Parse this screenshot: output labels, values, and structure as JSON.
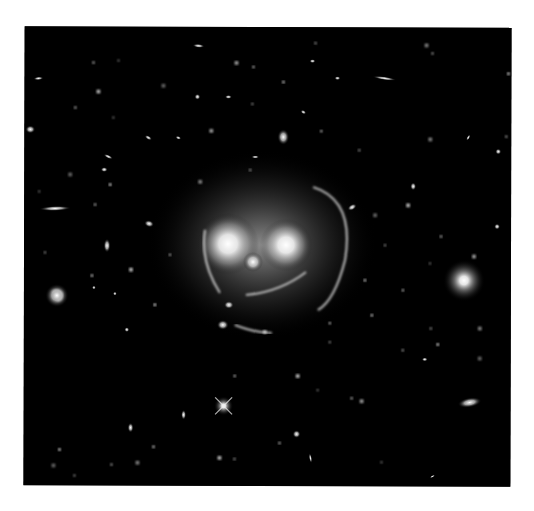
{
  "image": {
    "subject": "galaxy cluster with gravitational lensing arcs (smiley-face shape)",
    "background_color": "#000000",
    "page_color": "#ffffff",
    "frame": {
      "x": 24,
      "y": 27,
      "width": 487,
      "height": 459
    }
  },
  "cluster": {
    "halo": {
      "cx": 262,
      "cy": 245,
      "rx": 115,
      "ry": 95
    },
    "eyes": [
      {
        "cx": 228,
        "cy": 244,
        "r": 14
      },
      {
        "cx": 286,
        "cy": 245,
        "r": 12
      }
    ],
    "nose": {
      "cx": 253,
      "cy": 262,
      "r": 5
    },
    "arcs": [
      {
        "name": "right-ring-arc",
        "d": "M 313 187 Q 355 200 345 260 Q 335 300 318 310"
      },
      {
        "name": "left-ring-arc",
        "d": "M 205 230 Q 200 262 220 293"
      },
      {
        "name": "smile-arc",
        "d": "M 246 295 Q 280 292 306 272"
      },
      {
        "name": "lower-smile-arc",
        "d": "M 235 325 Q 255 333 272 333"
      }
    ]
  },
  "objects": [
    {
      "type": "spiral",
      "cx": 57,
      "cy": 296,
      "r": 9
    },
    {
      "type": "elliptical",
      "cx": 464,
      "cy": 280,
      "r": 14
    },
    {
      "type": "star",
      "cx": 224,
      "cy": 406,
      "r": 6
    },
    {
      "type": "edge-on",
      "cx": 55,
      "cy": 209,
      "rx": 16,
      "ry": 2.5,
      "rot": -2
    },
    {
      "type": "edge-on",
      "cx": 384,
      "cy": 78,
      "rx": 12,
      "ry": 1.8,
      "rot": 8
    },
    {
      "type": "elliptical",
      "cx": 470,
      "cy": 402,
      "rx": 12,
      "ry": 5,
      "rot": -10
    },
    {
      "type": "elliptical",
      "cx": 283,
      "cy": 137,
      "rx": 6,
      "ry": 8,
      "rot": 0
    },
    {
      "type": "elliptical",
      "cx": 107,
      "cy": 246,
      "rx": 3.5,
      "ry": 7,
      "rot": 0
    },
    {
      "type": "elliptical",
      "cx": 149,
      "cy": 224,
      "rx": 5,
      "ry": 3.5,
      "rot": 15
    },
    {
      "type": "elliptical",
      "cx": 30,
      "cy": 130,
      "rx": 5,
      "ry": 4,
      "rot": 0
    },
    {
      "type": "elliptical",
      "cx": 198,
      "cy": 46,
      "rx": 6,
      "ry": 2,
      "rot": 5
    },
    {
      "type": "elliptical",
      "cx": 104,
      "cy": 170,
      "rx": 3.5,
      "ry": 2.5,
      "rot": 0
    },
    {
      "type": "elliptical",
      "cx": 197,
      "cy": 97,
      "rx": 3,
      "ry": 3,
      "rot": 0
    },
    {
      "type": "elliptical",
      "cx": 108,
      "cy": 157,
      "rx": 5,
      "ry": 1.8,
      "rot": 25
    },
    {
      "type": "elliptical",
      "cx": 38,
      "cy": 79,
      "rx": 5,
      "ry": 1.8,
      "rot": -5
    },
    {
      "type": "elliptical",
      "cx": 223,
      "cy": 325,
      "rx": 6,
      "ry": 5,
      "rot": 0
    },
    {
      "type": "elliptical",
      "cx": 229,
      "cy": 305,
      "rx": 5,
      "ry": 4,
      "rot": 0
    },
    {
      "type": "elliptical",
      "cx": 352,
      "cy": 207,
      "rx": 5,
      "ry": 3,
      "rot": -30
    },
    {
      "type": "elliptical",
      "cx": 297,
      "cy": 434,
      "rx": 4,
      "ry": 4,
      "rot": 0
    },
    {
      "type": "elliptical",
      "cx": 131,
      "cy": 428,
      "rx": 3,
      "ry": 5,
      "rot": 0
    },
    {
      "type": "elliptical",
      "cx": 311,
      "cy": 458,
      "rx": 1.5,
      "ry": 5,
      "rot": -10
    },
    {
      "type": "elliptical",
      "cx": 184,
      "cy": 415,
      "rx": 2.5,
      "ry": 5,
      "rot": 0
    },
    {
      "type": "elliptical",
      "cx": 413,
      "cy": 186,
      "rx": 3,
      "ry": 4,
      "rot": 0
    },
    {
      "type": "elliptical",
      "cx": 497,
      "cy": 226,
      "rx": 3,
      "ry": 3,
      "rot": 0
    },
    {
      "type": "elliptical",
      "cx": 312,
      "cy": 61,
      "rx": 3,
      "ry": 2,
      "rot": 0
    },
    {
      "type": "elliptical",
      "cx": 337,
      "cy": 78,
      "rx": 3,
      "ry": 2,
      "rot": 0
    },
    {
      "type": "elliptical",
      "cx": 228,
      "cy": 97,
      "rx": 3.5,
      "ry": 2,
      "rot": 0
    },
    {
      "type": "elliptical",
      "cx": 303,
      "cy": 112,
      "rx": 3,
      "ry": 2,
      "rot": 30
    },
    {
      "type": "elliptical",
      "cx": 498,
      "cy": 151,
      "rx": 3,
      "ry": 3,
      "rot": 0
    },
    {
      "type": "elliptical",
      "cx": 468,
      "cy": 137,
      "rx": 1.5,
      "ry": 3.5,
      "rot": 30
    },
    {
      "type": "elliptical",
      "cx": 127,
      "cy": 330,
      "rx": 2.5,
      "ry": 2.5,
      "rot": 0
    },
    {
      "type": "elliptical",
      "cx": 178,
      "cy": 138,
      "rx": 3,
      "ry": 1.8,
      "rot": 20
    },
    {
      "type": "elliptical",
      "cx": 115,
      "cy": 294,
      "rx": 2,
      "ry": 2,
      "rot": 0
    },
    {
      "type": "elliptical",
      "cx": 94,
      "cy": 288,
      "rx": 2,
      "ry": 2,
      "rot": 0
    },
    {
      "type": "elliptical",
      "cx": 148,
      "cy": 138,
      "rx": 4,
      "ry": 2,
      "rot": 30
    },
    {
      "type": "elliptical",
      "cx": 255,
      "cy": 157,
      "rx": 4,
      "ry": 1.5,
      "rot": 0
    },
    {
      "type": "elliptical",
      "cx": 425,
      "cy": 359,
      "rx": 3,
      "ry": 2,
      "rot": 0
    },
    {
      "type": "elliptical",
      "cx": 433,
      "cy": 476,
      "rx": 3,
      "ry": 1.2,
      "rot": -30
    }
  ],
  "stars": [
    [
      118,
      61
    ],
    [
      93,
      63
    ],
    [
      236,
      63
    ],
    [
      253,
      67
    ],
    [
      315,
      43
    ],
    [
      426,
      45
    ],
    [
      432,
      53
    ],
    [
      508,
      73
    ],
    [
      163,
      86
    ],
    [
      252,
      104
    ],
    [
      283,
      82
    ],
    [
      98,
      92
    ],
    [
      113,
      118
    ],
    [
      75,
      108
    ],
    [
      211,
      131
    ],
    [
      321,
      131
    ],
    [
      359,
      150
    ],
    [
      430,
      139
    ],
    [
      506,
      136
    ],
    [
      110,
      185
    ],
    [
      70,
      175
    ],
    [
      45,
      253
    ],
    [
      92,
      276
    ],
    [
      131,
      270
    ],
    [
      430,
      263
    ],
    [
      441,
      236
    ],
    [
      474,
      256
    ],
    [
      403,
      290
    ],
    [
      431,
      328
    ],
    [
      480,
      328
    ],
    [
      403,
      350
    ],
    [
      438,
      344
    ],
    [
      480,
      358
    ],
    [
      330,
      342
    ],
    [
      372,
      315
    ],
    [
      298,
      376
    ],
    [
      318,
      390
    ],
    [
      352,
      398
    ],
    [
      362,
      401
    ],
    [
      235,
      376
    ],
    [
      235,
      459
    ],
    [
      138,
      463
    ],
    [
      112,
      465
    ],
    [
      60,
      450
    ],
    [
      54,
      466
    ],
    [
      75,
      476
    ],
    [
      154,
      447
    ],
    [
      220,
      458
    ],
    [
      382,
      462
    ],
    [
      280,
      443
    ],
    [
      265,
      332
    ],
    [
      330,
      323
    ],
    [
      250,
      170
    ],
    [
      200,
      182
    ],
    [
      170,
      255
    ],
    [
      155,
      305
    ],
    [
      375,
      215
    ],
    [
      385,
      245
    ],
    [
      365,
      280
    ],
    [
      408,
      205
    ],
    [
      39,
      192
    ],
    [
      95,
      205
    ]
  ]
}
